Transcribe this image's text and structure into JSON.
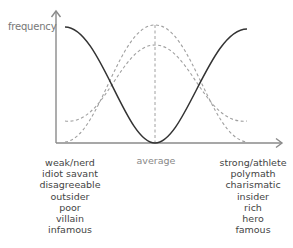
{
  "diagram": {
    "y_axis_label": "frequency",
    "x_axis_center_label": "average",
    "left_traits": [
      "weak/nerd",
      "idiot savant",
      "disagreeable",
      "outsider",
      "poor",
      "villain",
      "infamous"
    ],
    "right_traits": [
      "strong/athlete",
      "polymath",
      "charismatic",
      "insider",
      "rich",
      "hero",
      "famous"
    ],
    "curves": [
      {
        "name": "inverted-bell-solid",
        "style": "solid",
        "color": "#333333",
        "shape": "high at extremes, zero at average"
      },
      {
        "name": "tall-bell-dashed",
        "style": "dashed",
        "color": "#999999",
        "shape": "peak at average, near zero at extremes"
      },
      {
        "name": "short-bell-dashed",
        "style": "dashed",
        "color": "#999999",
        "shape": "lower peak at average, nonzero tails"
      }
    ],
    "colors": {
      "axis": "#888888",
      "solid_curve": "#333333",
      "dashed_curve": "#a0a0a0",
      "text": "#555555"
    }
  }
}
